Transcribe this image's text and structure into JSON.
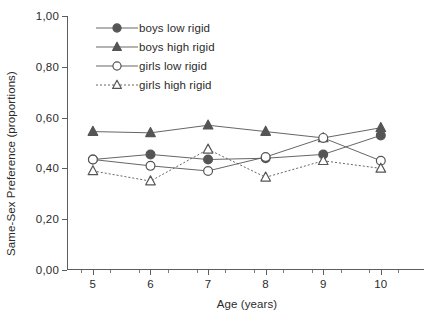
{
  "chart_data": {
    "type": "line",
    "title": "",
    "xlabel": "Age (years)",
    "ylabel": "Same-Sex Preference (proportions)",
    "x": [
      5,
      6,
      7,
      8,
      9,
      10
    ],
    "xtick_labels": [
      "5",
      "6",
      "7",
      "8",
      "9",
      "10"
    ],
    "ytick_labels": [
      "0,00",
      "0,20",
      "0,40",
      "0,60",
      "0,80",
      "1,00"
    ],
    "ytick_values": [
      0.0,
      0.2,
      0.4,
      0.6,
      0.8,
      1.0
    ],
    "xlim": [
      4.55,
      10.75
    ],
    "ylim": [
      0.0,
      1.0
    ],
    "grid": false,
    "legend_position": "upper-left-inside",
    "decimal_separator": ",",
    "series": [
      {
        "name": "boys low rigid",
        "marker": "filled-circle",
        "linestyle": "solid",
        "color": "#555555",
        "values": [
          0.435,
          0.455,
          0.435,
          0.44,
          0.455,
          0.53
        ]
      },
      {
        "name": "boys high rigid",
        "marker": "filled-triangle",
        "linestyle": "solid",
        "color": "#555555",
        "values": [
          0.545,
          0.54,
          0.57,
          0.545,
          0.52,
          0.56
        ]
      },
      {
        "name": "girls low rigid",
        "marker": "open-circle",
        "linestyle": "solid",
        "color": "#555555",
        "values": [
          0.435,
          0.41,
          0.39,
          0.445,
          0.52,
          0.43
        ]
      },
      {
        "name": "girls high rigid",
        "marker": "open-triangle",
        "linestyle": "dotted",
        "color": "#555555",
        "values": [
          0.39,
          0.35,
          0.475,
          0.365,
          0.43,
          0.4
        ]
      }
    ]
  },
  "axes": {
    "y_title": "Same-Sex Preference (proportions)",
    "x_title": "Age (years)"
  },
  "legend": {
    "items": [
      {
        "label": "boys low rigid"
      },
      {
        "label": "boys high rigid"
      },
      {
        "label": "girls low rigid"
      },
      {
        "label": "girls high rigid"
      }
    ]
  }
}
